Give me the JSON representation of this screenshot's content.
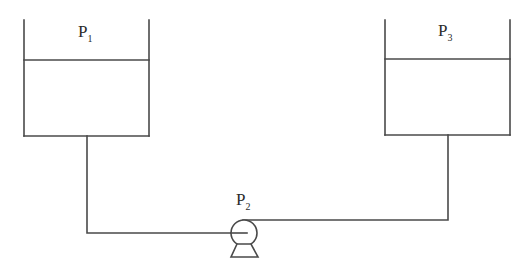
{
  "diagram": {
    "type": "pump-tank-system",
    "stroke_color": "#4a4a4a",
    "labels": {
      "tank_left": {
        "base": "P",
        "sub": "1"
      },
      "pump": {
        "base": "P",
        "sub": "2"
      },
      "tank_right": {
        "base": "P",
        "sub": "3"
      }
    },
    "components": [
      {
        "id": "tank-left",
        "kind": "open-tank",
        "label": "P1"
      },
      {
        "id": "pump",
        "kind": "centrifugal-pump",
        "label": "P2"
      },
      {
        "id": "tank-right",
        "kind": "open-tank",
        "label": "P3"
      }
    ],
    "connections": [
      {
        "from": "tank-left",
        "to": "pump",
        "enters": "pump-center"
      },
      {
        "from": "pump",
        "to": "tank-right",
        "leaves": "pump-top"
      }
    ]
  }
}
